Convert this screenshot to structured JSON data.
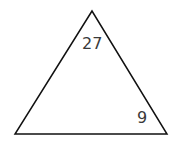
{
  "diagram": {
    "shape": "triangle",
    "vertices": [
      [
        92,
        11
      ],
      [
        15,
        134
      ],
      [
        167,
        134
      ]
    ],
    "stroke_color": "#111111",
    "labels": {
      "top_angle": "27",
      "bottom_right_angle": "9"
    }
  }
}
